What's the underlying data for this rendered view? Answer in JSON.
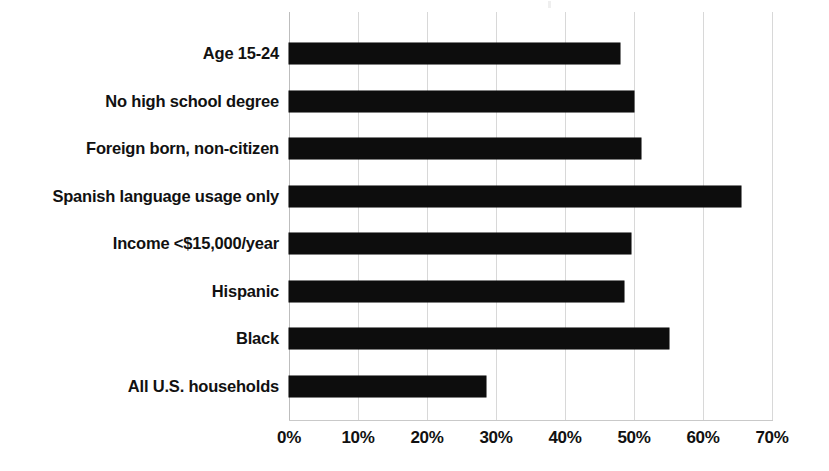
{
  "chart_data": {
    "type": "bar",
    "orientation": "horizontal",
    "title": "",
    "subtitle": "",
    "xlabel": "",
    "ylabel": "",
    "categories": [
      "Age 15-24",
      "No high school degree",
      "Foreign born, non-citizen",
      "Spanish language usage only",
      "Income <$15,000/year",
      "Hispanic",
      "Black",
      "All U.S. households"
    ],
    "values": [
      48,
      50,
      51,
      65.5,
      49.5,
      48.5,
      55,
      28.5
    ],
    "value_suffix": "%",
    "xlim": [
      0,
      70
    ],
    "xticks": [
      0,
      10,
      20,
      30,
      40,
      50,
      60,
      70
    ],
    "xticklabels": [
      "0%",
      "10%",
      "20%",
      "30%",
      "40%",
      "50%",
      "60%",
      "70%"
    ],
    "grid": "vertical",
    "legend": "none",
    "series": [
      {
        "name": "",
        "color": "#0d0d0d",
        "values": [
          48,
          50,
          51,
          65.5,
          49.5,
          48.5,
          55,
          28.5
        ]
      }
    ]
  },
  "colors": {
    "bar": "#0d0d0d",
    "gridline": "#d8d8d8",
    "axis": "#c9c9c9",
    "text": "#111111",
    "background": "#ffffff"
  }
}
